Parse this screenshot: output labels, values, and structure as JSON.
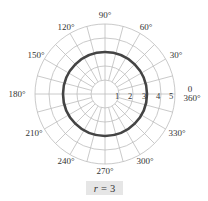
{
  "chart_data": {
    "type": "polar",
    "title": "",
    "equation": {
      "variable": "r",
      "operator": "=",
      "value": "3"
    },
    "series": [
      {
        "name": "r = 3",
        "kind": "circle",
        "r": 3,
        "theta_range_deg": [
          0,
          360
        ],
        "color": "#444444"
      }
    ],
    "radial_axis": {
      "ticks": [
        1,
        2,
        3,
        4,
        5
      ],
      "tick_labels": [
        "1",
        "2",
        "3",
        "4",
        "5"
      ],
      "range": [
        0,
        5
      ]
    },
    "angular_axis": {
      "ticks_deg": [
        0,
        30,
        60,
        90,
        120,
        150,
        180,
        210,
        240,
        270,
        300,
        330
      ],
      "tick_labels": [
        "0",
        "30°",
        "60°",
        "90°",
        "120°",
        "150°",
        "180°",
        "210°",
        "240°",
        "270°",
        "300°",
        "330°"
      ],
      "zero_label_extra": "360°",
      "grid_step_deg": 15
    },
    "grid": true
  },
  "labels": {
    "a0": "0",
    "a360": "360°",
    "a30": "30°",
    "a60": "60°",
    "a90": "90°",
    "a120": "120°",
    "a150": "150°",
    "a180": "180°",
    "a210": "210°",
    "a240": "240°",
    "a270": "270°",
    "a300": "300°",
    "a330": "330°",
    "r1": "1",
    "r2": "2",
    "r3": "3",
    "r4": "4",
    "r5": "5"
  },
  "caption": {
    "variable": "r",
    "operator": "=",
    "value": "3"
  },
  "colors": {
    "grid": "#bdbdbd",
    "curve": "#444444",
    "caption_bg": "#e6e6e6"
  }
}
